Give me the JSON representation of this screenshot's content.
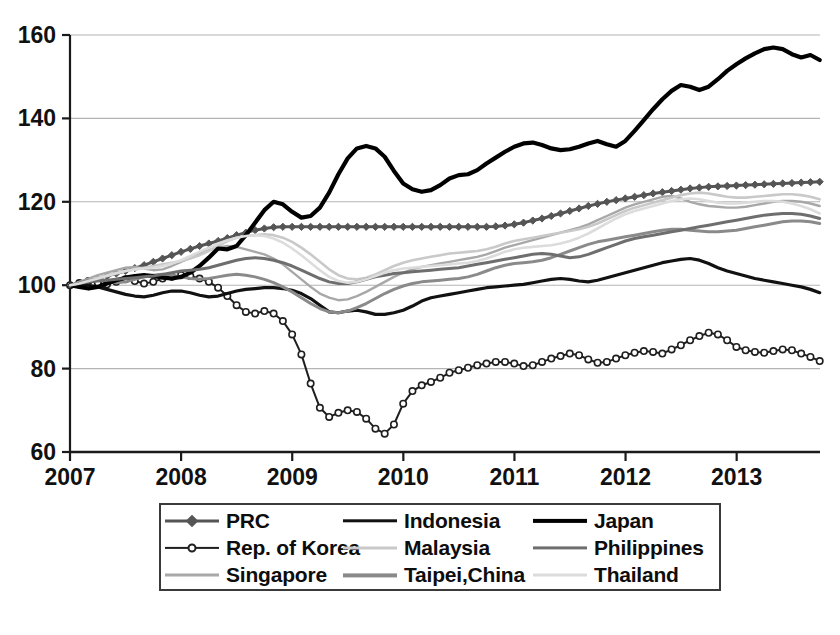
{
  "chart_data": {
    "type": "line",
    "title": "",
    "xlabel": "",
    "ylabel": "",
    "xlim": [
      2007.0,
      2013.75
    ],
    "ylim": [
      60,
      160
    ],
    "grid": true,
    "legend_position": "bottom",
    "ytick_labels": [
      "160",
      "140",
      "120",
      "100",
      "80",
      "60"
    ],
    "ytick_values": [
      160,
      140,
      120,
      100,
      80,
      60
    ],
    "xtick_labels": [
      "2007",
      "2008",
      "2009",
      "2010",
      "2011",
      "2012",
      "2013"
    ],
    "xtick_values": [
      2007,
      2008,
      2009,
      2010,
      2011,
      2012,
      2013
    ],
    "x_step": 0.0833,
    "series": [
      {
        "name": "PRC",
        "color": "#555555",
        "width": 3.0,
        "marker": "filled-diamond",
        "x_start": 2007.0,
        "values": [
          100,
          100.4,
          101,
          101.6,
          102.2,
          102.8,
          103.4,
          104.1,
          104.8,
          105.6,
          106.4,
          107.2,
          108,
          108.7,
          109.4,
          110,
          110.6,
          111.3,
          112,
          112.6,
          113.2,
          113.6,
          113.9,
          114,
          114,
          114,
          114,
          114,
          114,
          114,
          114,
          114,
          114,
          114,
          114,
          114,
          114,
          114,
          114,
          114,
          114,
          114,
          114,
          114,
          114,
          114,
          114.1,
          114.3,
          114.6,
          115,
          115.5,
          116,
          116.6,
          117.2,
          117.8,
          118.4,
          119,
          119.5,
          120,
          120.4,
          120.8,
          121.2,
          121.6,
          122,
          122.3,
          122.6,
          122.9,
          123.2,
          123.4,
          123.6,
          123.7,
          123.8,
          123.9,
          124,
          124.1,
          124.2,
          124.3,
          124.4,
          124.5,
          124.6,
          124.7,
          124.8,
          124.9,
          125.1,
          125.3,
          125.5,
          125.8,
          126,
          126.2,
          126.4,
          126.5,
          126.6,
          126.7
        ]
      },
      {
        "name": "Rep. of Korea",
        "color": "#1f1f1f",
        "width": 2.0,
        "marker": "hollow-circle",
        "x_start": 2007.0,
        "values": [
          100,
          100.5,
          101,
          100.6,
          100.2,
          100.8,
          101.4,
          101,
          100.4,
          100.8,
          101.6,
          102,
          102.4,
          102.2,
          101.6,
          100.8,
          99.4,
          97.4,
          95.2,
          93.6,
          93.2,
          93.8,
          93.2,
          91.4,
          88.2,
          83.4,
          76.4,
          70.6,
          68.4,
          69.4,
          70,
          69.6,
          68,
          65.6,
          64.4,
          66.6,
          71.6,
          74.6,
          76,
          76.8,
          77.8,
          79,
          79.6,
          80.2,
          80.8,
          81.2,
          81.6,
          81.6,
          81.2,
          80.6,
          80.8,
          81.6,
          82.4,
          83,
          83.6,
          83.2,
          82.2,
          81.4,
          81.6,
          82.4,
          83.2,
          83.8,
          84.2,
          84,
          83.6,
          84.6,
          85.6,
          86.8,
          87.8,
          88.6,
          88.2,
          86.8,
          85.2,
          84.4,
          84,
          83.8,
          84.2,
          84.6,
          84.4,
          83.6,
          82.8,
          81.8,
          81.2,
          81.6,
          82.4,
          83.4,
          84.4,
          85.4,
          86.4,
          87,
          86.6,
          85.8,
          86.6
        ]
      },
      {
        "name": "Singapore",
        "color": "#a8a8a8",
        "width": 2.4,
        "x_start": 2007.0,
        "values": [
          100,
          100.8,
          101.6,
          102.4,
          103,
          103.6,
          104.2,
          104.4,
          104,
          103.6,
          103.8,
          104.6,
          105.6,
          106.6,
          107.6,
          108.4,
          109,
          109.4,
          109.2,
          108.6,
          108,
          107.4,
          106.4,
          105,
          103.2,
          101.4,
          99.6,
          98,
          97,
          96.4,
          96.6,
          97.4,
          98.4,
          99.6,
          100.8,
          102,
          103,
          103.8,
          104.4,
          104.8,
          105.2,
          105.6,
          106,
          106.4,
          106.8,
          107.4,
          108.2,
          109,
          109.6,
          110.2,
          110.8,
          111.4,
          112,
          112.6,
          113.2,
          113.8,
          114.6,
          115.6,
          116.6,
          117.6,
          118.6,
          119.4,
          120,
          120.6,
          121.2,
          121.4,
          120.8,
          120,
          119.4,
          119,
          118.8,
          118.6,
          118.6,
          118.8,
          119.2,
          119.6,
          120,
          120.2,
          120.2,
          120,
          119.6,
          119,
          118.2,
          117.2,
          116,
          114.6,
          113.2,
          112,
          111,
          110.2,
          109.4,
          108.6,
          107.6
        ]
      },
      {
        "name": "Indonesia",
        "color": "#111111",
        "width": 3.2,
        "x_start": 2007.0,
        "values": [
          100,
          100.2,
          100,
          99.6,
          99,
          98.4,
          97.8,
          97.4,
          97.2,
          97.6,
          98.2,
          98.6,
          98.6,
          98.2,
          97.6,
          97.2,
          97.4,
          98,
          98.6,
          99,
          99.2,
          99.4,
          99.4,
          99.2,
          98.8,
          98,
          96.8,
          95.2,
          93.6,
          93.4,
          93.8,
          94,
          93.6,
          93,
          93,
          93.4,
          94,
          95,
          96.2,
          97,
          97.4,
          97.8,
          98.2,
          98.6,
          99,
          99.4,
          99.6,
          99.8,
          100,
          100.2,
          100.6,
          101,
          101.4,
          101.6,
          101.4,
          101,
          100.8,
          101.2,
          101.8,
          102.4,
          103,
          103.6,
          104.2,
          104.8,
          105.4,
          105.8,
          106.2,
          106.4,
          106,
          105.2,
          104.2,
          103.4,
          102.8,
          102.2,
          101.6,
          101.2,
          100.8,
          100.4,
          100,
          99.6,
          99,
          98.2,
          97.4,
          96.8,
          96.2,
          95.6,
          95,
          94.6,
          94.4,
          94.2,
          94,
          94,
          94
        ]
      },
      {
        "name": "Malaysia",
        "color": "#c9c9c9",
        "width": 2.6,
        "x_start": 2007.0,
        "values": [
          100,
          100.6,
          101.2,
          101.8,
          102.4,
          103,
          103.4,
          103.8,
          104.2,
          104.6,
          105,
          105.4,
          105.8,
          106.4,
          107.2,
          108.2,
          109.4,
          110.6,
          111.4,
          111.8,
          112,
          112.2,
          112,
          111.4,
          110.4,
          109,
          107.4,
          105.6,
          103.8,
          102.4,
          101.6,
          101.4,
          101.8,
          102.6,
          103.6,
          104.6,
          105.4,
          106,
          106.4,
          106.8,
          107.2,
          107.6,
          107.8,
          108,
          108.2,
          108.6,
          109.2,
          110,
          110.6,
          111,
          111.4,
          111.8,
          112.2,
          112.6,
          113,
          113.4,
          114,
          114.8,
          115.8,
          116.8,
          117.8,
          118.6,
          119.2,
          119.8,
          120.4,
          121,
          121.6,
          122,
          122.2,
          122,
          121.6,
          121.2,
          121,
          121,
          121.2,
          121.4,
          121.6,
          121.8,
          121.8,
          121.6,
          121.2,
          120.6,
          119.8,
          118.8,
          117.6,
          116.2,
          114.8,
          113.6,
          112.6,
          111.8,
          111.2,
          110.8,
          110.6
        ]
      },
      {
        "name": "Taipei,China",
        "color": "#8a8a8a",
        "width": 3.0,
        "x_start": 2007.0,
        "values": [
          100,
          100.6,
          101.2,
          101.4,
          101,
          100.6,
          100.8,
          101.4,
          102,
          102.4,
          102.6,
          102.4,
          102,
          101.6,
          101.4,
          101.6,
          102,
          102.4,
          102.6,
          102.4,
          102,
          101.4,
          100.6,
          99.6,
          98.4,
          97,
          95.6,
          94.4,
          93.6,
          93.4,
          93.8,
          94.6,
          95.6,
          96.8,
          98,
          99,
          99.8,
          100.4,
          100.8,
          101,
          101.2,
          101.4,
          101.6,
          102,
          102.6,
          103.4,
          104.2,
          104.8,
          105.2,
          105.4,
          105.6,
          106,
          106.6,
          107.4,
          108.2,
          109,
          109.8,
          110.4,
          110.8,
          111.2,
          111.6,
          112,
          112.4,
          112.8,
          113.2,
          113.4,
          113.4,
          113.2,
          113,
          112.8,
          112.8,
          113,
          113.2,
          113.6,
          114,
          114.4,
          114.8,
          115.2,
          115.4,
          115.4,
          115.2,
          114.8,
          114.2,
          113.6,
          113,
          112.6,
          112.4,
          112.4,
          112.6,
          112.8,
          113,
          113.2,
          113.4
        ]
      },
      {
        "name": "Japan",
        "color": "#000000",
        "width": 4.2,
        "x_start": 2007.0,
        "values": [
          100,
          99.6,
          99.2,
          99.6,
          100.4,
          101.2,
          101.8,
          102.2,
          102.4,
          102.2,
          101.8,
          101.6,
          102,
          103,
          104.6,
          106.6,
          108.8,
          108.6,
          109.4,
          112,
          115,
          118,
          120,
          119.4,
          117.6,
          116.2,
          116.6,
          118.6,
          122.2,
          126.6,
          130.4,
          132.8,
          133.4,
          132.8,
          130.8,
          127.4,
          124.4,
          123,
          122.4,
          122.8,
          124,
          125.6,
          126.4,
          126.6,
          127.6,
          129.2,
          130.6,
          132,
          133.2,
          134,
          134.2,
          133.6,
          132.8,
          132.4,
          132.6,
          133.2,
          134,
          134.6,
          133.8,
          133.2,
          134.6,
          137,
          139.6,
          142.2,
          144.6,
          146.6,
          148,
          147.6,
          146.8,
          147.6,
          149.4,
          151.4,
          153,
          154.4,
          155.6,
          156.6,
          157,
          156.6,
          155.4,
          154.6,
          155.2,
          154,
          151.4,
          148.6,
          147.4,
          148.6,
          150.4,
          152,
          153.4,
          154.4,
          154.6,
          153.4,
          150,
          145,
          138,
          132,
          127,
          124,
          122,
          124.4,
          122.6,
          121.8,
          124.4,
          123,
          122.6
        ]
      },
      {
        "name": "Philippines",
        "color": "#6e6e6e",
        "width": 3.0,
        "x_start": 2007.0,
        "values": [
          100,
          100.4,
          100.8,
          101,
          101.2,
          101.4,
          101.6,
          101.8,
          102,
          102.2,
          102.6,
          103,
          103.4,
          103.6,
          103.8,
          104.2,
          104.8,
          105.4,
          106,
          106.4,
          106.6,
          106.4,
          106,
          105.4,
          104.6,
          103.6,
          102.6,
          101.6,
          100.8,
          100.4,
          100.4,
          100.8,
          101.4,
          102,
          102.4,
          102.8,
          103,
          103.2,
          103.4,
          103.6,
          103.8,
          104,
          104.2,
          104.6,
          105,
          105.4,
          105.8,
          106.2,
          106.6,
          107,
          107.4,
          107.6,
          107.4,
          107,
          106.6,
          106.8,
          107.4,
          108.2,
          109,
          109.8,
          110.6,
          111.2,
          111.6,
          112,
          112.4,
          112.8,
          113.2,
          113.6,
          114,
          114.4,
          114.8,
          115.2,
          115.6,
          116,
          116.4,
          116.8,
          117,
          117.2,
          117.2,
          117,
          116.6,
          116,
          115.2,
          114.4,
          113.8,
          113.4,
          113.2,
          113.2,
          113.4,
          113.6,
          113.4,
          113,
          112.4
        ]
      },
      {
        "name": "Thailand",
        "color": "#dcdcdc",
        "width": 2.6,
        "x_start": 2007.0,
        "values": [
          100,
          100.4,
          101,
          101.6,
          102.2,
          102.8,
          103.4,
          103.8,
          104,
          104.2,
          104.6,
          105.2,
          106,
          107,
          108,
          109,
          110,
          110.8,
          111.4,
          111.8,
          112,
          111.8,
          111.2,
          110.2,
          108.8,
          107.2,
          105.4,
          103.6,
          102,
          101,
          100.6,
          100.8,
          101.4,
          102.2,
          103,
          103.6,
          104,
          104.2,
          104.4,
          104.6,
          104.8,
          105,
          105.2,
          105.4,
          105.8,
          106.4,
          107.2,
          108,
          108.6,
          109,
          109.2,
          109.4,
          109.6,
          110,
          110.6,
          111.4,
          112.4,
          113.6,
          114.8,
          116,
          117,
          117.8,
          118.4,
          119,
          119.6,
          120.2,
          120.6,
          120.8,
          120.6,
          120.2,
          119.8,
          119.6,
          119.6,
          119.8,
          120,
          120.2,
          120.2,
          120,
          119.6,
          119,
          118.2,
          117.2,
          116,
          114.6,
          113.2,
          112,
          111,
          110.2,
          109.6,
          109.2,
          109,
          108.8,
          108.6
        ]
      }
    ]
  },
  "legend": {
    "items": [
      {
        "label": "PRC",
        "marker": "filled-diamond",
        "color": "#555555",
        "width": 3.0
      },
      {
        "label": "Indonesia",
        "marker": "none",
        "color": "#111111",
        "width": 3.4
      },
      {
        "label": "Japan",
        "marker": "none",
        "color": "#000000",
        "width": 4.2
      },
      {
        "label": "Rep. of Korea",
        "marker": "hollow-circle",
        "color": "#1f1f1f",
        "width": 2.2
      },
      {
        "label": "Malaysia",
        "marker": "none",
        "color": "#c9c9c9",
        "width": 3.0
      },
      {
        "label": "Philippines",
        "marker": "none",
        "color": "#6e6e6e",
        "width": 3.2
      },
      {
        "label": "Singapore",
        "marker": "none",
        "color": "#a8a8a8",
        "width": 3.0
      },
      {
        "label": "Taipei,China",
        "marker": "none",
        "color": "#8a8a8a",
        "width": 3.2
      },
      {
        "label": "Thailand",
        "marker": "none",
        "color": "#dcdcdc",
        "width": 3.0
      }
    ]
  },
  "colors": {
    "background": "#ffffff",
    "gridline": "#b4b4b4",
    "axis": "#1a1a1a",
    "text": "#111111",
    "legend_border": "#3a3a3a"
  }
}
